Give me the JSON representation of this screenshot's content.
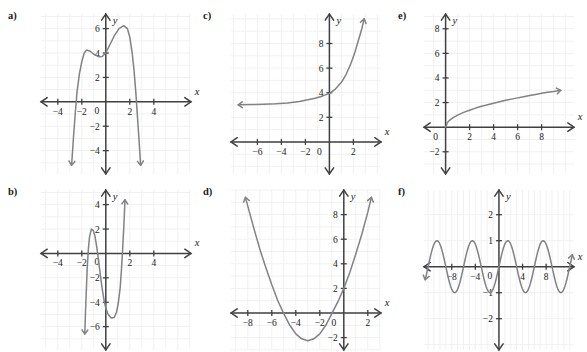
{
  "page": {
    "background_color": "#ffffff",
    "curve_color": "#808285",
    "axis_color": "#414042",
    "grid_color": "#f1f1f2"
  },
  "panels": [
    {
      "id": "a",
      "label": "a)",
      "axis_labels": {
        "x": "x",
        "y": "y"
      },
      "x_ticks": [
        -4,
        -2,
        0,
        2,
        4
      ],
      "y_ticks": [
        -4,
        -2,
        2,
        4,
        6
      ],
      "origin_label": "0"
    },
    {
      "id": "b",
      "label": "b)",
      "axis_labels": {
        "x": "x",
        "y": "y"
      },
      "x_ticks": [
        -4,
        -2,
        0,
        2,
        4
      ],
      "y_ticks": [
        -6,
        -4,
        -2,
        2,
        4
      ],
      "origin_label": "0"
    },
    {
      "id": "c",
      "label": "c)",
      "axis_labels": {
        "x": "x",
        "y": "y"
      },
      "x_ticks": [
        -6,
        -4,
        -2,
        0,
        2
      ],
      "y_ticks": [
        2,
        4,
        6,
        8
      ],
      "origin_label": "0"
    },
    {
      "id": "d",
      "label": "d)",
      "axis_labels": {
        "x": "x",
        "y": "y"
      },
      "x_ticks": [
        -8,
        -6,
        -4,
        -2,
        0,
        2
      ],
      "y_ticks": [
        -2,
        2,
        4,
        6,
        8
      ],
      "origin_label": "0"
    },
    {
      "id": "e",
      "label": "e)",
      "axis_labels": {
        "x": "x",
        "y": "y"
      },
      "x_ticks": [
        2,
        4,
        6,
        8
      ],
      "y_ticks": [
        -2,
        2,
        4,
        6,
        8
      ],
      "origin_label": "0"
    },
    {
      "id": "f",
      "label": "f)",
      "axis_labels": {
        "x": "x",
        "y": "y"
      },
      "x_ticks": [
        -8,
        -4,
        4,
        8
      ],
      "y_ticks": [
        -2,
        -1,
        1,
        2
      ],
      "origin_label": "0"
    }
  ],
  "chart_data": [
    {
      "id": "a",
      "type": "line",
      "title": "",
      "xlabel": "x",
      "ylabel": "y",
      "xlim": [
        -5.5,
        5.5
      ],
      "ylim": [
        -5.5,
        7.0
      ],
      "grid": true,
      "description": "Quartic with negative leading coefficient; local max near (-1.6, 4.2), local min near (-0.2, 3.7), absolute max near (1.4, 6.2); falls steeply past x = -2.6 and x = 2.3",
      "points": [
        [
          -2.85,
          -5.2
        ],
        [
          -2.7,
          -3.0
        ],
        [
          -2.55,
          -1.0
        ],
        [
          -2.4,
          0.8
        ],
        [
          -2.2,
          2.3
        ],
        [
          -2.0,
          3.3
        ],
        [
          -1.8,
          4.0
        ],
        [
          -1.6,
          4.25
        ],
        [
          -1.3,
          4.15
        ],
        [
          -1.0,
          3.9
        ],
        [
          -0.6,
          3.7
        ],
        [
          -0.3,
          3.72
        ],
        [
          0.0,
          4.0
        ],
        [
          0.3,
          4.6
        ],
        [
          0.7,
          5.4
        ],
        [
          1.1,
          6.0
        ],
        [
          1.5,
          6.25
        ],
        [
          1.8,
          6.0
        ],
        [
          2.0,
          5.3
        ],
        [
          2.2,
          4.0
        ],
        [
          2.35,
          2.6
        ],
        [
          2.5,
          0.8
        ],
        [
          2.65,
          -1.4
        ],
        [
          2.8,
          -3.6
        ],
        [
          2.9,
          -5.2
        ]
      ]
    },
    {
      "id": "b",
      "type": "line",
      "title": "",
      "xlabel": "x",
      "ylabel": "y",
      "xlim": [
        -5.5,
        5.5
      ],
      "ylim": [
        -7.0,
        5.0
      ],
      "grid": true,
      "description": "Cubic-like curve, local maximum near (-1.2, 2.0), local minimum near (0.6, -5.3), rising steeply through x = 1.4",
      "points": [
        [
          -1.75,
          -6.6
        ],
        [
          -1.7,
          -5.0
        ],
        [
          -1.62,
          -3.0
        ],
        [
          -1.55,
          -1.2
        ],
        [
          -1.45,
          0.4
        ],
        [
          -1.35,
          1.4
        ],
        [
          -1.2,
          2.0
        ],
        [
          -1.05,
          1.9
        ],
        [
          -0.9,
          1.4
        ],
        [
          -0.75,
          0.5
        ],
        [
          -0.6,
          -0.6
        ],
        [
          -0.45,
          -1.8
        ],
        [
          -0.3,
          -2.9
        ],
        [
          -0.15,
          -3.8
        ],
        [
          0.0,
          -4.5
        ],
        [
          0.2,
          -5.0
        ],
        [
          0.45,
          -5.3
        ],
        [
          0.7,
          -5.25
        ],
        [
          0.9,
          -4.8
        ],
        [
          1.05,
          -4.0
        ],
        [
          1.2,
          -2.8
        ],
        [
          1.3,
          -1.4
        ],
        [
          1.4,
          0.3
        ],
        [
          1.5,
          2.2
        ],
        [
          1.6,
          4.4
        ]
      ]
    },
    {
      "id": "c",
      "type": "line",
      "title": "",
      "xlabel": "x",
      "ylabel": "y",
      "xlim": [
        -8.0,
        3.6
      ],
      "ylim": [
        -1.5,
        10.0
      ],
      "grid": true,
      "description": "Exponential growth curve with horizontal asymptote near y = 3; passes through (0, 3.9) and rises sharply to about y = 10 near x = 3",
      "points": [
        [
          -7.6,
          3.02
        ],
        [
          -6.5,
          3.04
        ],
        [
          -5.5,
          3.07
        ],
        [
          -4.5,
          3.1
        ],
        [
          -3.5,
          3.17
        ],
        [
          -2.5,
          3.28
        ],
        [
          -1.8,
          3.42
        ],
        [
          -1.2,
          3.55
        ],
        [
          -0.6,
          3.72
        ],
        [
          0.0,
          3.95
        ],
        [
          0.5,
          4.3
        ],
        [
          1.0,
          4.85
        ],
        [
          1.4,
          5.5
        ],
        [
          1.8,
          6.4
        ],
        [
          2.1,
          7.2
        ],
        [
          2.4,
          8.2
        ],
        [
          2.7,
          9.2
        ],
        [
          2.9,
          10.0
        ]
      ]
    },
    {
      "id": "d",
      "type": "line",
      "title": "",
      "xlabel": "x",
      "ylabel": "y",
      "xlim": [
        -9.2,
        3.2
      ],
      "ylim": [
        -3.0,
        9.8
      ],
      "grid": true,
      "description": "Upward parabola with vertex near (-3, -2.2), x-intercepts near -5.1 and -0.9, y-intercept at (0, 2)",
      "points": [
        [
          -8.2,
          9.4
        ],
        [
          -7.5,
          6.9
        ],
        [
          -7.0,
          5.2
        ],
        [
          -6.5,
          3.7
        ],
        [
          -6.0,
          2.3
        ],
        [
          -5.5,
          1.0
        ],
        [
          -5.0,
          -0.05
        ],
        [
          -4.5,
          -1.0
        ],
        [
          -4.0,
          -1.7
        ],
        [
          -3.5,
          -2.1
        ],
        [
          -3.0,
          -2.25
        ],
        [
          -2.5,
          -2.1
        ],
        [
          -2.0,
          -1.7
        ],
        [
          -1.5,
          -1.0
        ],
        [
          -1.0,
          -0.05
        ],
        [
          -0.5,
          0.9
        ],
        [
          0.0,
          2.0
        ],
        [
          0.5,
          3.3
        ],
        [
          1.0,
          4.8
        ],
        [
          1.5,
          6.4
        ],
        [
          2.0,
          8.2
        ],
        [
          2.3,
          9.4
        ]
      ]
    },
    {
      "id": "e",
      "type": "line",
      "title": "",
      "xlabel": "x",
      "ylabel": "y",
      "xlim": [
        -1.6,
        10.6
      ],
      "ylim": [
        -3.0,
        9.0
      ],
      "grid": true,
      "description": "Square-root style curve starting at the origin and increasing to about y = 3 at x = 10",
      "points": [
        [
          0.0,
          0.0
        ],
        [
          0.15,
          0.38
        ],
        [
          0.35,
          0.58
        ],
        [
          0.6,
          0.76
        ],
        [
          1.0,
          0.98
        ],
        [
          1.5,
          1.2
        ],
        [
          2.0,
          1.38
        ],
        [
          2.5,
          1.55
        ],
        [
          3.0,
          1.7
        ],
        [
          3.5,
          1.82
        ],
        [
          4.0,
          1.95
        ],
        [
          4.5,
          2.07
        ],
        [
          5.0,
          2.18
        ],
        [
          5.5,
          2.28
        ],
        [
          6.0,
          2.38
        ],
        [
          6.5,
          2.48
        ],
        [
          7.0,
          2.58
        ],
        [
          7.5,
          2.66
        ],
        [
          8.0,
          2.75
        ],
        [
          8.5,
          2.83
        ],
        [
          9.0,
          2.9
        ],
        [
          9.6,
          3.0
        ]
      ]
    },
    {
      "id": "f",
      "type": "line",
      "title": "",
      "xlabel": "x",
      "ylabel": "y",
      "xlim": [
        -12.5,
        12.5
      ],
      "ylim": [
        -2.8,
        2.8
      ],
      "grid": true,
      "description": "Sinusoid with amplitude 1 and period about 6 units; sin(x) shape passing through the origin going upward",
      "amplitude": 1,
      "period": 6.0,
      "function": "y = sin(2*pi*x/6)"
    }
  ]
}
